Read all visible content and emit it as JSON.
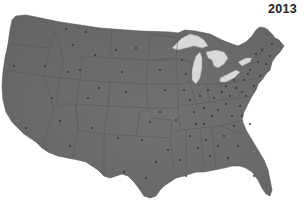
{
  "map": {
    "title": "2013",
    "region": "Contiguous United States",
    "colors": {
      "land": "#6b6b6b",
      "land_dark": "#5a5a5a",
      "borders": "#4f4f4f",
      "lakes": "#d9d9d9",
      "dots": "#2e2e2e",
      "background": "#ffffff"
    },
    "features": [
      "state-borders",
      "great-lakes",
      "station-dots"
    ]
  }
}
